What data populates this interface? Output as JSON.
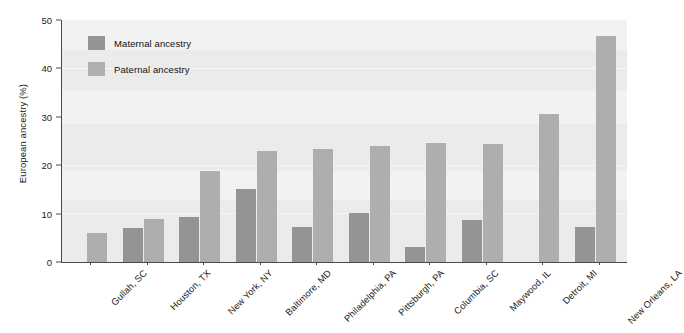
{
  "chart_data": {
    "type": "bar",
    "title": "",
    "xlabel": "",
    "ylabel": "European ancestry (%)",
    "ylim": [
      0,
      50
    ],
    "yticks": [
      0,
      10,
      20,
      30,
      40,
      50
    ],
    "grid": true,
    "legend_position": "top-left",
    "categories": [
      "Gullah, SC",
      "Houston, TX",
      "New York, NY",
      "Baltimore, MD",
      "Philadelphia, PA",
      "Pittsburgh, PA",
      "Columbia, SC",
      "Maywood, IL",
      "Detroit, MI",
      "New Orleans, LA"
    ],
    "series": [
      {
        "name": "Maternal ancestry",
        "color": "#949494",
        "values": [
          0,
          7.1,
          9.3,
          15.0,
          7.2,
          10.2,
          3.0,
          8.7,
          0,
          7.3
        ]
      },
      {
        "name": "Paternal ancestry",
        "color": "#aeaeae",
        "values": [
          6.0,
          8.8,
          18.9,
          23.0,
          23.4,
          24.0,
          24.5,
          24.4,
          30.5,
          46.7
        ]
      }
    ]
  },
  "legend": {
    "items": [
      {
        "label": "Maternal ancestry",
        "color": "#949494"
      },
      {
        "label": "Paternal ancestry",
        "color": "#b0b0b0"
      }
    ]
  },
  "axis": {
    "y_title": "European ancestry (%)",
    "y_tick_labels": [
      "50",
      "40",
      "30",
      "20",
      "10",
      "0"
    ]
  }
}
